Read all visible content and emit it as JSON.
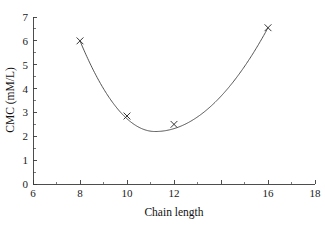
{
  "chart_data": {
    "type": "line",
    "title": "",
    "subtitle": "",
    "xlabel": "Chain length",
    "ylabel": "CMC (mM/L)",
    "xlim": [
      6,
      18
    ],
    "ylim": [
      0,
      7
    ],
    "grid": false,
    "legend": null,
    "legend_position": "none",
    "marker": "x",
    "line_color": "#4a4a4a",
    "marker_color": "#2a2a2a",
    "background_color": "#ffffff",
    "x": [
      8,
      10,
      12,
      16
    ],
    "values": [
      6.0,
      2.85,
      2.5,
      6.55
    ],
    "points": [
      {
        "x": 8,
        "y": 6.0
      },
      {
        "x": 10,
        "y": 2.85
      },
      {
        "x": 12,
        "y": 2.5
      },
      {
        "x": 16,
        "y": 6.55
      }
    ],
    "curve_minimum": {
      "x": 11.2,
      "y": 2.2
    },
    "xticks_major": [
      6,
      8,
      10,
      12,
      14,
      16,
      18
    ],
    "xtick_labels": [
      "6",
      "8",
      "10",
      "12",
      "",
      "16",
      "18"
    ],
    "xticks_minor": [
      7,
      9,
      11,
      13,
      15,
      17
    ],
    "yticks_major": [
      0,
      1,
      2,
      3,
      4,
      5,
      6,
      7
    ],
    "ytick_labels": [
      "0",
      "1",
      "2",
      "3",
      "4",
      "5",
      "6",
      "7"
    ],
    "yticks_minor": [
      0.5,
      1.5,
      2.5,
      3.5,
      4.5,
      5.5,
      6.5
    ],
    "annotations": []
  }
}
